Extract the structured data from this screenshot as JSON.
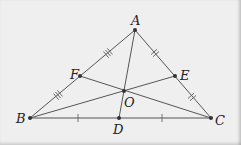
{
  "figure": {
    "background": "#efefef",
    "line_color": "#555555",
    "points": {
      "A": {
        "label": "A",
        "x": 135,
        "y": 30
      },
      "B": {
        "label": "B",
        "x": 30,
        "y": 118
      },
      "C": {
        "label": "C",
        "x": 211,
        "y": 118
      },
      "D": {
        "label": "D",
        "x": 119,
        "y": 118
      },
      "E": {
        "label": "E",
        "x": 175,
        "y": 76
      },
      "F": {
        "label": "F",
        "x": 80,
        "y": 76
      },
      "O": {
        "label": "O",
        "x": 124,
        "y": 91
      }
    },
    "segments": [
      "AB",
      "BC",
      "CA",
      "AD",
      "BE",
      "CF"
    ],
    "tick_marks": {
      "AF": 3,
      "FB": 3,
      "AE": 2,
      "EC": 2,
      "BD": 1,
      "DC": 1
    }
  }
}
